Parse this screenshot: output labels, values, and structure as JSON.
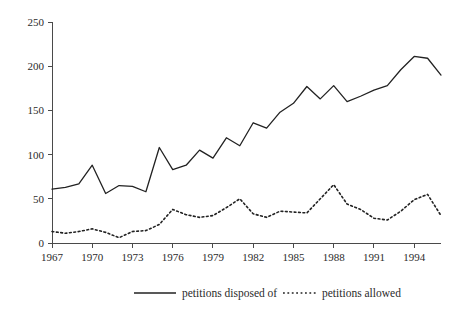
{
  "chart_data": {
    "type": "line",
    "title": "",
    "subtitle": "",
    "xlabel": "",
    "ylabel": "",
    "xlim": [
      1967,
      1996
    ],
    "ylim": [
      0,
      250
    ],
    "grid": false,
    "legend_position": "bottom-center",
    "x": [
      1967,
      1968,
      1969,
      1970,
      1971,
      1972,
      1973,
      1974,
      1975,
      1976,
      1977,
      1978,
      1979,
      1980,
      1981,
      1982,
      1983,
      1984,
      1985,
      1986,
      1987,
      1988,
      1989,
      1990,
      1991,
      1992,
      1993,
      1994,
      1995,
      1996
    ],
    "xticks": [
      1967,
      1970,
      1973,
      1976,
      1979,
      1982,
      1985,
      1988,
      1991,
      1994
    ],
    "xticklabels": [
      "1967",
      "1970",
      "1973",
      "1976",
      "1979",
      "1982",
      "1985",
      "1988",
      "1991",
      "1994"
    ],
    "yticks": [
      0,
      50,
      100,
      150,
      200,
      250
    ],
    "yticklabels": [
      "0",
      "50",
      "100",
      "150",
      "200",
      "250"
    ],
    "series": [
      {
        "name": "petitions disposed of",
        "style": "solid",
        "color": "#222222",
        "values": [
          61,
          63,
          67,
          88,
          56,
          65,
          64,
          58,
          108,
          83,
          88,
          105,
          96,
          119,
          110,
          136,
          130,
          148,
          158,
          177,
          163,
          178,
          160,
          166,
          173,
          178,
          196,
          211,
          209,
          190
        ]
      },
      {
        "name": "petitions allowed",
        "style": "dotted",
        "color": "#222222",
        "values": [
          13,
          11,
          13,
          16,
          12,
          6,
          13,
          14,
          21,
          38,
          32,
          29,
          31,
          40,
          50,
          33,
          29,
          36,
          35,
          34,
          50,
          66,
          44,
          38,
          28,
          26,
          36,
          49,
          55,
          31
        ]
      }
    ]
  },
  "legend": {
    "items": [
      {
        "label": "petitions disposed of",
        "style": "solid"
      },
      {
        "label": "petitions allowed",
        "style": "dotted"
      }
    ]
  }
}
